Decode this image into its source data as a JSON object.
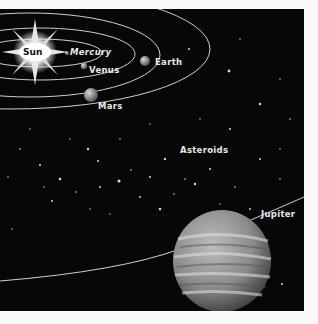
{
  "illustration": {
    "title": "Solar system diagram",
    "background_color": "#070707",
    "bodies": [
      {
        "name": "sun",
        "label": "Sun"
      },
      {
        "name": "mercury",
        "label": "Mercury"
      },
      {
        "name": "venus",
        "label": "Venus"
      },
      {
        "name": "earth",
        "label": "Earth"
      },
      {
        "name": "mars",
        "label": "Mars"
      },
      {
        "name": "asteroids",
        "label": "Asteroids"
      },
      {
        "name": "jupiter",
        "label": "Jupiter"
      }
    ]
  }
}
